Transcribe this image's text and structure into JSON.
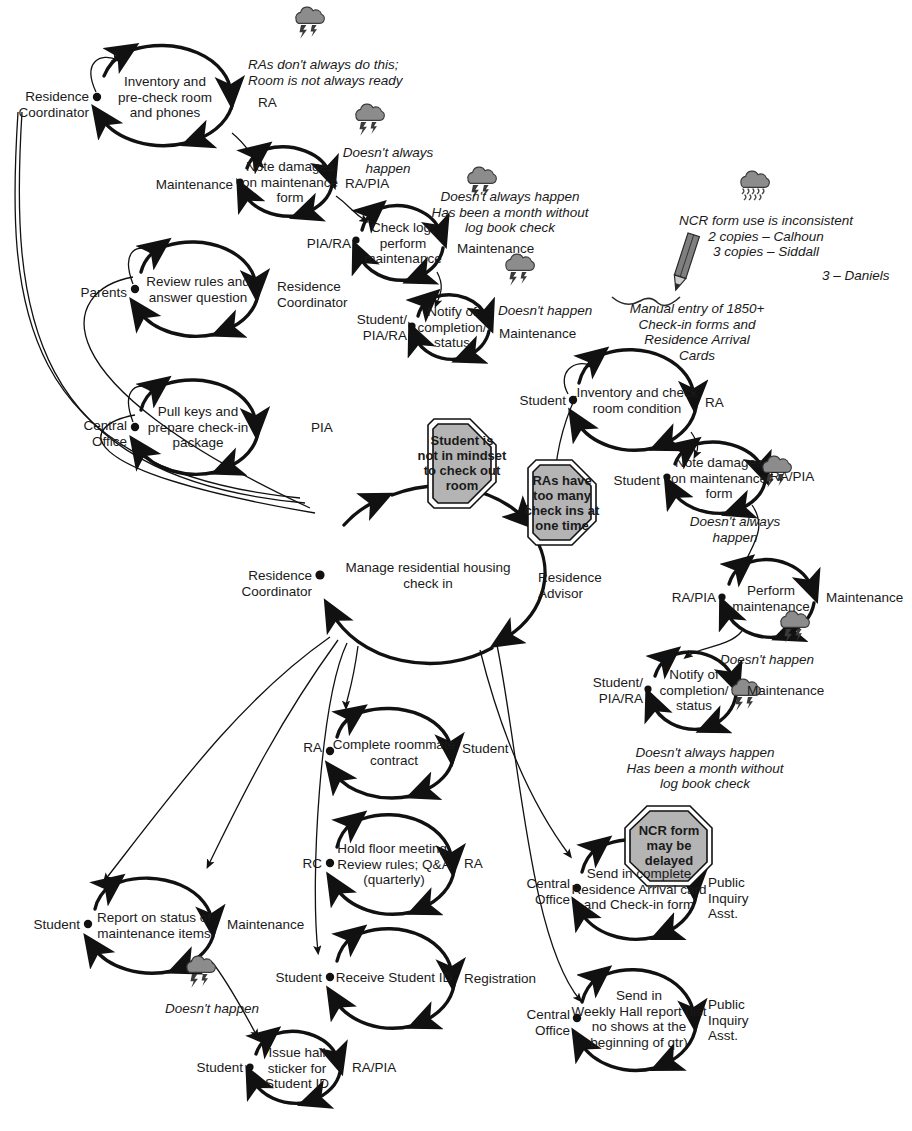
{
  "diagram": {
    "title": "Manage residential housing check in",
    "type": "role-activity interaction / IDEF-style loop diagram",
    "colors": {
      "line": "#111111",
      "text": "#1a1a1a",
      "octagon_fill": "#b4b4b4",
      "cloud_fill": "#8c8c8c",
      "background": "#ffffff"
    }
  },
  "center": {
    "label": "Manage residential housing\ncheck in",
    "left_role": "Residence\nCoordinator",
    "right_role": "Residence\nAdvisor"
  },
  "processes": [
    {
      "id": "inventory-precheck",
      "label": "Inventory and\npre-check room\nand phones",
      "left_role": "Residence\nCoordinator",
      "right_role": "RA"
    },
    {
      "id": "note-damages-1",
      "label": "Note damages\non maintenance\nform",
      "left_role": "Maintenance",
      "right_role": "RA/PIA"
    },
    {
      "id": "check-log",
      "label": "Check log;\nperform\nmaintenance",
      "left_role": "PIA/RA",
      "right_role": "Maintenance"
    },
    {
      "id": "notify-completion-1",
      "label": "Notify of\ncompletion/\nstatus",
      "left_role": "Student/\nPIA/RA",
      "right_role": "Maintenance"
    },
    {
      "id": "review-rules",
      "label": "Review rules and\nanswer question",
      "left_role": "Parents",
      "right_role": "Residence\nCoordinator"
    },
    {
      "id": "pull-keys",
      "label": "Pull keys and\nprepare check-in\npackage",
      "left_role": "Central\nOffice",
      "right_role": "PIA"
    },
    {
      "id": "inventory-check-room",
      "label": "Inventory and check\nroom condition",
      "left_role": "Student",
      "right_role": "RA"
    },
    {
      "id": "note-damages-2",
      "label": "Note damages\non maintenance\nform",
      "left_role": "Student",
      "right_role": "RA/PIA"
    },
    {
      "id": "perform-maintenance",
      "label": "Perform\nmaintenance",
      "left_role": "RA/PIA",
      "right_role": "Maintenance"
    },
    {
      "id": "notify-completion-2",
      "label": "Notify of\ncompletion/\nstatus",
      "left_role": "Student/\nPIA/RA",
      "right_role": "Maintenance"
    },
    {
      "id": "roommate-contract",
      "label": "Complete roommate\ncontract",
      "left_role": "RA",
      "right_role": "Student"
    },
    {
      "id": "floor-meeting",
      "label": "Hold floor meeting;\nReview rules; Q&A\n(quarterly)",
      "left_role": "RC",
      "right_role": "RA"
    },
    {
      "id": "receive-student-id",
      "label": "Receive Student ID",
      "left_role": "Student",
      "right_role": "Registration"
    },
    {
      "id": "report-maintenance-status",
      "label": "Report on status of\nmaintenance items",
      "left_role": "Student",
      "right_role": "Maintenance"
    },
    {
      "id": "issue-hall-sticker",
      "label": "Issue hall\nsticker for\nStudent ID",
      "left_role": "Student",
      "right_role": "RA/PIA"
    },
    {
      "id": "send-arrival-card",
      "label": "Send in complete\nResidence Arrival card\nand Check-in form",
      "left_role": "Central\nOffice",
      "right_role": "Public\nInquiry\nAsst."
    },
    {
      "id": "send-weekly-hall-report",
      "label": "Send in\nWeekly Hall report (list\nno shows at the\nbeginning of qtr)",
      "left_role": "Central\nOffice",
      "right_role": "Public\nInquiry\nAsst."
    }
  ],
  "notes": [
    {
      "id": "note-ras-dont-always",
      "text": "RAs don't always do this;\nRoom is not always ready",
      "icon": "storm-cloud-icon"
    },
    {
      "id": "note-doesnt-always-happen-1",
      "text": "Doesn't always\nhappen",
      "icon": "storm-cloud-icon"
    },
    {
      "id": "note-log-book-check-1",
      "text": "Doesn't always happen\nHas been a month without\nlog book check",
      "icon": "storm-cloud-icon"
    },
    {
      "id": "note-doesnt-happen-1",
      "text": "Doesn't happen",
      "icon": "storm-cloud-icon"
    },
    {
      "id": "note-ncr-inconsistent",
      "text": "NCR form use is inconsistent\n2 copies – Calhoun\n3 copies – Siddall",
      "icon": "rain-cloud-icon"
    },
    {
      "id": "note-ncr-daniels",
      "text": "3 – Daniels",
      "icon": "none"
    },
    {
      "id": "note-manual-entry",
      "text": "Manual entry of 1850+\nCheck-in forms and\nResidence Arrival\nCards",
      "icon": "pencil-icon"
    },
    {
      "id": "note-doesnt-always-happen-2",
      "text": "Doesn't always\nhappen",
      "icon": "storm-cloud-icon"
    },
    {
      "id": "note-doesnt-happen-2",
      "text": "Doesn't happen",
      "icon": "storm-cloud-icon"
    },
    {
      "id": "note-log-book-check-2",
      "text": "Doesn't always happen\nHas been a month without\nlog book check",
      "icon": "storm-cloud-icon"
    },
    {
      "id": "note-doesnt-happen-3",
      "text": "Doesn't happen",
      "icon": "storm-cloud-icon"
    }
  ],
  "issues": [
    {
      "id": "issue-student-mindset",
      "text": "Student is\nnot in mindset\nto check out\nroom"
    },
    {
      "id": "issue-ras-too-many",
      "text": "RAs have\ntoo many\ncheck ins at\none time"
    },
    {
      "id": "issue-ncr-delayed",
      "text": "NCR form\nmay be\ndelayed"
    }
  ]
}
